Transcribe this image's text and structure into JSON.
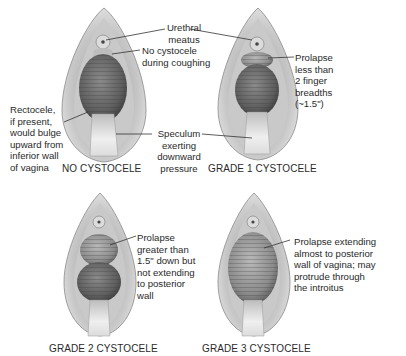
{
  "diagram": {
    "panels": [
      {
        "id": "no-cystocele",
        "caption": "NO CYSTOCELE",
        "labels": {
          "urethral_meatus": "Urethral\nmeatus",
          "no_cystocele": "No cystocele\nduring coughing",
          "rectocele": "Rectocele,\nif present,\nwould bulge\nupward from\ninferior wall\nof vagina",
          "speculum": "Speculum\nexerting\ndownward\npressure"
        }
      },
      {
        "id": "grade-1",
        "caption": "GRADE 1 CYSTOCELE",
        "labels": {
          "prolapse": "Prolapse\nless than\n2 finger\nbreadths\n(~1.5\")"
        }
      },
      {
        "id": "grade-2",
        "caption": "GRADE 2 CYSTOCELE",
        "labels": {
          "prolapse": "Prolapse\ngreater than\n1.5\" down but\nnot extending\nto posterior\nwall"
        }
      },
      {
        "id": "grade-3",
        "caption": "GRADE 3 CYSTOCELE",
        "labels": {
          "prolapse": "Prolapse extending\nalmost to posterior\nwall of vagina; may\nprotrude through\nthe introitus"
        }
      }
    ],
    "colors": {
      "background": "#ffffff",
      "tissue_light": "#d8d8d8",
      "tissue_mid": "#a9a9a9",
      "tissue_dark": "#555555",
      "speculum": "#e6e6e6",
      "leader_line": "#333333"
    }
  }
}
